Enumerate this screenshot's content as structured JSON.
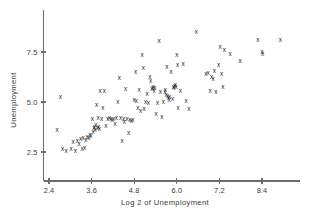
{
  "chart_data": {
    "type": "scatter",
    "title": "",
    "xlabel": "Log 2 of Unemployment",
    "ylabel": "Unemployment",
    "xlim": [
      2.25,
      9.35
    ],
    "ylim": [
      1.55,
      8.75
    ],
    "grid": false,
    "legend": null,
    "marker": "x",
    "marker_color": "#1a1a1a",
    "axis_color": "#6d6d6d",
    "background": "#ffffff",
    "xticks": [
      2.4,
      3.6,
      4.8,
      6.0,
      7.2,
      8.4
    ],
    "xticklabels": [
      "2.4",
      "3.6",
      "4.8",
      "6.0",
      "7.2",
      "8.4"
    ],
    "yticks": [
      2.5,
      5.0,
      7.5
    ],
    "yticklabels": [
      "2.5",
      "5.0",
      "7.5"
    ],
    "points": [
      [
        2.63,
        3.62
      ],
      [
        2.72,
        5.27
      ],
      [
        2.78,
        2.7
      ],
      [
        2.88,
        2.58
      ],
      [
        3.02,
        2.66
      ],
      [
        3.08,
        3.02
      ],
      [
        3.14,
        2.59
      ],
      [
        3.2,
        3.1
      ],
      [
        3.25,
        2.95
      ],
      [
        3.29,
        3.18
      ],
      [
        3.33,
        2.68
      ],
      [
        3.36,
        3.24
      ],
      [
        3.4,
        2.75
      ],
      [
        3.44,
        3.12
      ],
      [
        3.47,
        3.3
      ],
      [
        3.52,
        3.22
      ],
      [
        3.55,
        3.4
      ],
      [
        3.58,
        3.33
      ],
      [
        3.62,
        4.18
      ],
      [
        3.64,
        3.55
      ],
      [
        3.66,
        3.72
      ],
      [
        3.68,
        3.8
      ],
      [
        3.7,
        3.62
      ],
      [
        3.72,
        3.88
      ],
      [
        3.74,
        4.9
      ],
      [
        3.76,
        3.75
      ],
      [
        3.78,
        4.22
      ],
      [
        3.8,
        3.79
      ],
      [
        3.82,
        3.7
      ],
      [
        3.84,
        5.57
      ],
      [
        3.88,
        4.17
      ],
      [
        3.92,
        4.75
      ],
      [
        3.96,
        5.6
      ],
      [
        4.0,
        3.82
      ],
      [
        4.05,
        4.18
      ],
      [
        4.1,
        4.22
      ],
      [
        4.14,
        4.2
      ],
      [
        4.18,
        4.15
      ],
      [
        4.22,
        4.19
      ],
      [
        4.26,
        3.95
      ],
      [
        4.3,
        4.23
      ],
      [
        4.34,
        5.01
      ],
      [
        4.38,
        6.22
      ],
      [
        4.42,
        4.25
      ],
      [
        4.46,
        3.1
      ],
      [
        4.5,
        4.2
      ],
      [
        4.52,
        4.02
      ],
      [
        4.56,
        5.7
      ],
      [
        4.6,
        4.18
      ],
      [
        4.64,
        3.48
      ],
      [
        4.68,
        4.12
      ],
      [
        4.72,
        4.08
      ],
      [
        4.76,
        4.14
      ],
      [
        4.8,
        5.12
      ],
      [
        4.84,
        6.52
      ],
      [
        4.86,
        5.08
      ],
      [
        4.9,
        4.74
      ],
      [
        4.94,
        5.62
      ],
      [
        4.98,
        4.58
      ],
      [
        5.02,
        7.37
      ],
      [
        5.06,
        6.72
      ],
      [
        5.08,
        4.7
      ],
      [
        5.12,
        5.04
      ],
      [
        5.16,
        5.45
      ],
      [
        5.2,
        4.97
      ],
      [
        5.24,
        6.3
      ],
      [
        5.26,
        6.1
      ],
      [
        5.3,
        5.66
      ],
      [
        5.32,
        5.72
      ],
      [
        5.34,
        5.78
      ],
      [
        5.36,
        5.6
      ],
      [
        5.38,
        5.71
      ],
      [
        5.42,
        4.45
      ],
      [
        5.46,
        5.0
      ],
      [
        5.5,
        8.1
      ],
      [
        5.54,
        5.52
      ],
      [
        5.58,
        4.3
      ],
      [
        5.62,
        5.02
      ],
      [
        5.66,
        5.55
      ],
      [
        5.68,
        5.62
      ],
      [
        5.7,
        5.4
      ],
      [
        5.72,
        6.78
      ],
      [
        5.74,
        5.32
      ],
      [
        5.76,
        5.22
      ],
      [
        5.78,
        5.15
      ],
      [
        5.8,
        5.3
      ],
      [
        5.84,
        6.55
      ],
      [
        5.88,
        5.2
      ],
      [
        5.9,
        5.78
      ],
      [
        5.92,
        5.74
      ],
      [
        5.94,
        5.82
      ],
      [
        5.96,
        5.86
      ],
      [
        5.98,
        5.8
      ],
      [
        6.0,
        7.36
      ],
      [
        6.02,
        6.9
      ],
      [
        6.04,
        4.75
      ],
      [
        6.1,
        5.6
      ],
      [
        6.18,
        6.92
      ],
      [
        6.26,
        5.08
      ],
      [
        6.34,
        4.66
      ],
      [
        6.55,
        8.55
      ],
      [
        6.82,
        6.42
      ],
      [
        6.88,
        6.5
      ],
      [
        6.94,
        5.6
      ],
      [
        6.98,
        6.3
      ],
      [
        7.02,
        6.2
      ],
      [
        7.06,
        6.58
      ],
      [
        7.1,
        5.55
      ],
      [
        7.18,
        6.9
      ],
      [
        7.22,
        7.78
      ],
      [
        7.26,
        6.42
      ],
      [
        7.3,
        5.8
      ],
      [
        7.34,
        7.62
      ],
      [
        7.5,
        7.42
      ],
      [
        7.78,
        7.1
      ],
      [
        8.28,
        8.12
      ],
      [
        8.4,
        7.55
      ],
      [
        8.42,
        7.42
      ],
      [
        8.92,
        8.12
      ]
    ]
  }
}
